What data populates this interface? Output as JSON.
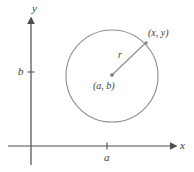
{
  "figure": {
    "type": "coordinate-geometry-diagram",
    "background_color": "#ffffff",
    "axis_color": "#4d4d4d",
    "curve_color": "#8c8c8c",
    "label_color": "#3b3b3b"
  },
  "axes": {
    "x_axis": {
      "label": "x",
      "origin_px": {
        "x": 31,
        "y": 146
      },
      "start_px": {
        "x": 8,
        "y": 146
      },
      "end_px": {
        "x": 176,
        "y": 146
      },
      "has_arrowhead": true,
      "label_px": {
        "x": 182,
        "y": 146
      }
    },
    "y_axis": {
      "label": "y",
      "start_px": {
        "x": 31,
        "y": 165
      },
      "end_px": {
        "x": 31,
        "y": 18
      },
      "has_arrowhead": true,
      "label_px": {
        "x": 33,
        "y": 10
      }
    }
  },
  "ticks": [
    {
      "name": "x-tick-a",
      "axis": "x",
      "label": "a",
      "position_px": {
        "x": 107,
        "y": 146
      },
      "label_px": {
        "x": 107,
        "y": 158
      }
    },
    {
      "name": "y-tick-b",
      "axis": "y",
      "label": "b",
      "position_px": {
        "x": 31,
        "y": 72
      },
      "label_px": {
        "x": 22,
        "y": 72
      }
    }
  ],
  "circle": {
    "center_px": {
      "x": 112,
      "y": 76
    },
    "radius_px": 46,
    "stroke_color": "#8c8c8c",
    "stroke_width": 1.1,
    "fill": "none"
  },
  "radius_segment": {
    "from_px": {
      "x": 112,
      "y": 75
    },
    "to_px": {
      "x": 146,
      "y": 43
    },
    "label": "r",
    "label_px": {
      "x": 122,
      "y": 56
    }
  },
  "points": [
    {
      "name": "center-point",
      "label": "(a, b)",
      "marker_px": {
        "x": 112,
        "y": 75
      },
      "label_px": {
        "x": 113,
        "y": 87
      },
      "marker_radius_px": 2
    },
    {
      "name": "circle-point",
      "label": "(x, y)",
      "marker_px": {
        "x": 146,
        "y": 43
      },
      "label_px": {
        "x": 157,
        "y": 34
      },
      "marker_radius_px": 1.8
    }
  ]
}
